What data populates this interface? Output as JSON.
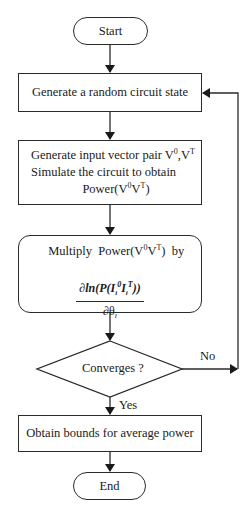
{
  "flowchart": {
    "start": "Start",
    "step1": "Generate a random circuit state",
    "step2": {
      "line1": "Generate input vector pair V",
      "line1_sup1": "0",
      "line1_mid": ",V",
      "line1_sup2": "T",
      "line2": "Simulate the circuit to obtain",
      "line3_pre": "Power(V",
      "line3_sup1": "0",
      "line3_mid": "V",
      "line3_sup2": "T",
      "line3_post": ")"
    },
    "step3": {
      "line1_pre": "Multiply  Power(V",
      "line1_sup1": "0",
      "line1_mid": "V",
      "line1_sup2": "T",
      "line1_post": ")  by",
      "numerator": "∂ln(P(I_i^0 I_i^T))",
      "denominator": "∂θ_i"
    },
    "decision": "Converges ?",
    "no_label": "No",
    "yes_label": "Yes",
    "step4": "Obtain bounds for average power",
    "end": "End"
  }
}
